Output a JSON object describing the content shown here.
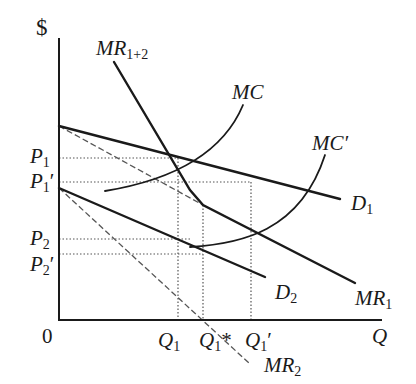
{
  "diagram": {
    "axes": {
      "y_label": "$",
      "x_label": "Q",
      "origin_label": "0"
    },
    "price_labels": [
      {
        "id": "p1",
        "main": "P",
        "sub": "1",
        "prime": ""
      },
      {
        "id": "p1prime",
        "main": "P",
        "sub": "1",
        "prime": "′"
      },
      {
        "id": "p2",
        "main": "P",
        "sub": "2",
        "prime": ""
      },
      {
        "id": "p2prime",
        "main": "P",
        "sub": "2",
        "prime": "′"
      }
    ],
    "quantity_labels": [
      {
        "id": "q1",
        "main": "Q",
        "sub": "1",
        "suffix": ""
      },
      {
        "id": "q1star",
        "main": "Q",
        "sub": "1",
        "suffix": "*"
      },
      {
        "id": "q1prime",
        "main": "Q",
        "sub": "1",
        "suffix": "′"
      }
    ],
    "curve_labels": {
      "mr12": {
        "main": "MR",
        "sub": "1+2"
      },
      "mc": {
        "main": "MC",
        "sub": ""
      },
      "mcprime": {
        "main": "MC′",
        "sub": ""
      },
      "d1": {
        "main": "D",
        "sub": "1"
      },
      "d2": {
        "main": "D",
        "sub": "2"
      },
      "mr1": {
        "main": "MR",
        "sub": "1"
      },
      "mr2": {
        "main": "MR",
        "sub": "2"
      }
    },
    "colors": {
      "line": "#1a1a1a",
      "dashed": "#555555",
      "dotted": "#555555",
      "background": "#ffffff"
    }
  }
}
